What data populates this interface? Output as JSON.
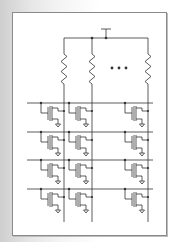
{
  "diagram": {
    "type": "circuit-schematic",
    "supply": {
      "label": "",
      "x": 106,
      "y": 29
    },
    "top_rail_y": 38,
    "columns": [
      {
        "id": "col-1",
        "x": 64
      },
      {
        "id": "col-2",
        "x": 92
      },
      {
        "id": "col-n",
        "x": 148
      }
    ],
    "ellipsis": "• • •",
    "rows": [
      {
        "id": "row-1",
        "y": 103
      },
      {
        "id": "row-2",
        "y": 132
      },
      {
        "id": "row-3",
        "y": 160
      },
      {
        "id": "row-4",
        "y": 189
      }
    ],
    "colors": {
      "wire": "#333333",
      "frame": "#8a8a8a",
      "background": "#ffffff"
    }
  }
}
